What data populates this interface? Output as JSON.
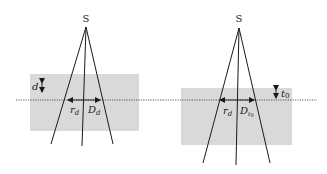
{
  "diagram": {
    "colors": {
      "background": "#ffffff",
      "slab": "#d9d9d9",
      "line": "#1a1a1a",
      "dotted": "#333333"
    },
    "left_panel": {
      "source_label": "S",
      "depth_label": "d",
      "radius_label": "r",
      "radius_subscript": "d",
      "diameter_label": "D",
      "diameter_subscript": "d"
    },
    "right_panel": {
      "source_label": "S",
      "thickness_label": "t",
      "thickness_subscript": "0",
      "radius_label": "r",
      "radius_subscript": "d",
      "diameter_label": "D",
      "diameter_subscript": "t",
      "diameter_subsubscript": "0"
    }
  }
}
